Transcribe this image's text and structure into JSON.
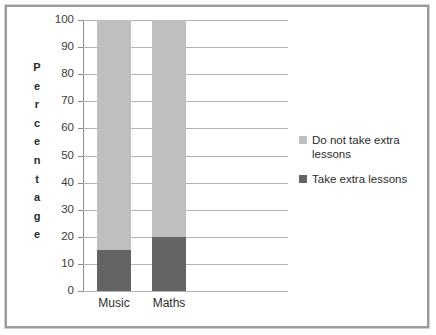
{
  "chart_data": {
    "type": "bar",
    "subtype": "stacked-100-percent",
    "title": "",
    "xlabel": "",
    "ylabel": "Percentage",
    "ylim": [
      0,
      100
    ],
    "yticks": [
      0,
      10,
      20,
      30,
      40,
      50,
      60,
      70,
      80,
      90,
      100
    ],
    "ytick_labels": [
      "0",
      "10",
      "20",
      "30",
      "40",
      "50",
      "60",
      "70",
      "80",
      "90",
      "100"
    ],
    "categories": [
      "Music",
      "Maths"
    ],
    "grid": true,
    "legend_position": "right",
    "series": [
      {
        "name": "Take extra lessons",
        "color": "#646464",
        "values": [
          15,
          20
        ]
      },
      {
        "name": "Do not take extra lessons",
        "color": "#bfbfbf",
        "values": [
          85,
          80
        ]
      }
    ],
    "stack_order_bottom_to_top": [
      "Take extra lessons",
      "Do not take extra lessons"
    ]
  },
  "axis": {
    "y_title_stacked": "P\ne\nr\nc\ne\nn\nt\na\ng\ne"
  },
  "legend": {
    "items": [
      {
        "label": "Do not take extra lessons",
        "color": "#bfbfbf"
      },
      {
        "label": "Take extra lessons",
        "color": "#646464"
      }
    ]
  },
  "colors": {
    "gridline": "#b3b3b3",
    "axis": "#8c8c8c",
    "frame": "#9a9a9a",
    "background": "#ffffff",
    "text": "#2b2b2b"
  }
}
